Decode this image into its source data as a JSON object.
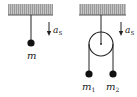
{
  "diagram": {
    "type": "physics-free-body-setup",
    "colors": {
      "ceiling_fill": "#a8a8a8",
      "ceiling_edge": "#555555",
      "line": "#222222",
      "background": "#ffffff"
    },
    "left_setup": {
      "description": "single mass hanging from ceiling",
      "mass_label": "m",
      "acceleration_label": "a",
      "acceleration_subscript": "S",
      "arrow_direction": "down"
    },
    "right_setup": {
      "description": "Atwood machine: pulley hanging from ceiling with two masses",
      "mass1_label": "m",
      "mass1_subscript": "1",
      "mass2_label": "m",
      "mass2_subscript": "2",
      "acceleration_label": "a",
      "acceleration_subscript": "S",
      "arrow_direction": "down"
    }
  }
}
